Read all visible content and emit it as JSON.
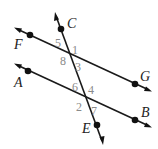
{
  "diagram": {
    "type": "parallel lines cut by a transversal",
    "lines": [
      {
        "name": "FG",
        "points": [
          "F",
          "G"
        ]
      },
      {
        "name": "AB",
        "points": [
          "A",
          "B"
        ]
      },
      {
        "name": "CE",
        "points": [
          "C",
          "E"
        ],
        "role": "transversal"
      }
    ],
    "points": {
      "C": "C",
      "F": "F",
      "G": "G",
      "A": "A",
      "B": "B",
      "E": "E"
    },
    "angles_top_intersection": {
      "a5": "5",
      "a1": "1",
      "a8": "8",
      "a3": "3"
    },
    "angles_bottom_intersection": {
      "a6": "6",
      "a4": "4",
      "a2": "2",
      "a7": "7"
    },
    "colors": {
      "line": "#1a1a1a",
      "point_label": "#222222",
      "angle_label": "#8a8a8a"
    }
  }
}
